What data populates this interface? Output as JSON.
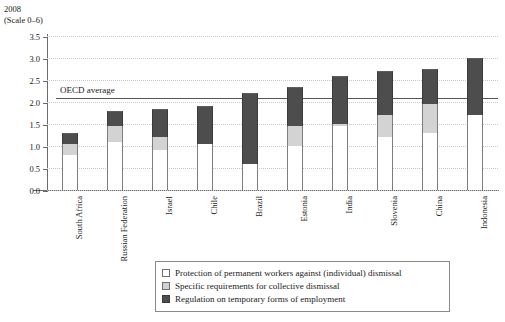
{
  "caption": {
    "year": "2008",
    "scale_note": "(Scale 0–6)"
  },
  "chart_data": {
    "type": "bar",
    "subtype": "stacked-bar",
    "title": "",
    "subtitle": "2008 (Scale 0–6)",
    "xlabel": "",
    "ylabel": "",
    "ylim": [
      0.0,
      3.5
    ],
    "grid": true,
    "legend_position": "bottom",
    "yticks": [
      "0.0",
      "0.5",
      "1.0",
      "1.5",
      "2.0",
      "2.5",
      "3.0",
      "3.5"
    ],
    "ytick_values": [
      0.0,
      0.5,
      1.0,
      1.5,
      2.0,
      2.5,
      3.0,
      3.5
    ],
    "categories": [
      "South Africa",
      "Russian Federation",
      "Israel",
      "Chile",
      "Brazil",
      "Estonia",
      "India",
      "Slovenia",
      "China",
      "Indonesia"
    ],
    "series": [
      {
        "name": "Protection of permanent workers against (individual) dismissal",
        "color": "#ffffff",
        "values": [
          0.8,
          1.1,
          0.9,
          1.05,
          0.6,
          1.0,
          1.45,
          1.2,
          1.3,
          1.7
        ]
      },
      {
        "name": "Specific requirements for collective dismissal",
        "color": "#d3d3d3",
        "values": [
          0.25,
          0.35,
          0.3,
          0.0,
          0.0,
          0.45,
          0.05,
          0.5,
          0.65,
          0.0
        ]
      },
      {
        "name": "Regulation on temporary forms of employment",
        "color": "#4d4d4d",
        "values": [
          0.25,
          0.35,
          0.65,
          0.85,
          1.6,
          0.9,
          1.1,
          1.0,
          0.8,
          1.3
        ]
      }
    ],
    "totals": [
      1.3,
      1.8,
      1.85,
      1.9,
      2.2,
      2.35,
      2.6,
      2.7,
      2.75,
      3.0
    ],
    "annotations": [
      {
        "label": "OECD average",
        "type": "hline",
        "value": 2.08
      }
    ]
  },
  "legend": {
    "items": [
      {
        "label": "Protection of permanent workers against (individual) dismissal",
        "swatch": "white"
      },
      {
        "label": "Specific requirements for collective dismissal",
        "swatch": "light-gray"
      },
      {
        "label": "Regulation on temporary forms of employment",
        "swatch": "dark-gray"
      }
    ]
  }
}
